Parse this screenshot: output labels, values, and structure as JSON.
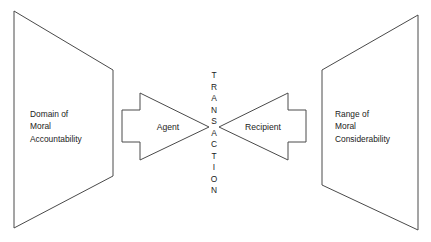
{
  "diagram": {
    "background_color": "#ffffff",
    "stroke_color": "#4a4a4a",
    "text_color": "#1b1b1b",
    "width": 431,
    "height": 242,
    "left_panel": {
      "name": "domain-of-moral-accountability",
      "lines": [
        "Domain of",
        "Moral",
        "Accountability"
      ],
      "shape": "trapezoid-left",
      "text_x": 30,
      "text_start_y": 117,
      "line_height": 12.4,
      "points": "14,11 113,70 113,176 14,228"
    },
    "right_panel": {
      "name": "range-of-moral-considerability",
      "lines": [
        "Range of",
        "Moral",
        "Considerability"
      ],
      "shape": "trapezoid-right",
      "text_x": 335,
      "text_start_y": 117,
      "line_height": 12.4,
      "points": "418,15 322,70 322,185 418,230"
    },
    "left_arrow": {
      "name": "agent-arrow",
      "label": "Agent",
      "direction": "right",
      "label_x": 168,
      "label_y": 130,
      "points": "122,110 140,110 140,93 209,127 140,160 140,142 122,142"
    },
    "right_arrow": {
      "name": "recipient-arrow",
      "label": "Recipient",
      "direction": "left",
      "label_x": 263,
      "label_y": 130,
      "points": "306,110 288,110 288,93 219,127 288,160 288,142 306,142"
    },
    "center_label": {
      "name": "transaction-vertical-label",
      "text": "TRANSACTION",
      "letters": [
        "T",
        "R",
        "A",
        "N",
        "S",
        "A",
        "C",
        "T",
        "I",
        "O",
        "N"
      ],
      "orientation": "vertical",
      "x": 214,
      "start_y": 78,
      "letter_spacing": 11.5
    }
  }
}
